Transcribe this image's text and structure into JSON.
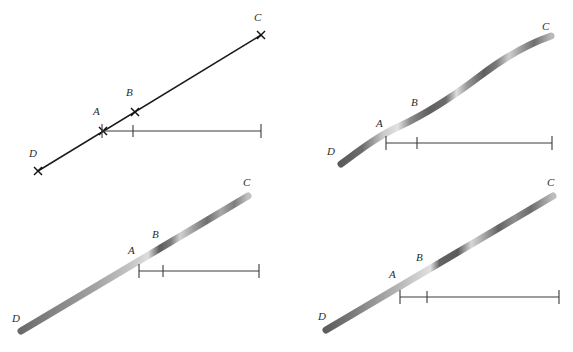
{
  "figure": {
    "title": "",
    "background_color": "#ffffff",
    "width": 573,
    "height": 352,
    "panel_count": 4,
    "point_labels": [
      "A",
      "B",
      "C",
      "D"
    ],
    "line_color": "#1a1a1a",
    "band_dark_color": "#5e5e5e",
    "band_mid_color": "#8f8f8f",
    "band_light_color": "#d8d8d8",
    "ruler_color": "#3a3a3a"
  },
  "panels": [
    {
      "id": "panel-top-left",
      "name": "thin-straight-line-panel",
      "style": "thin-line",
      "labels": {
        "A": "A",
        "B": "B",
        "C": "C",
        "D": "D"
      },
      "label_positions": {
        "A": {
          "x": 93,
          "y": 115
        },
        "B": {
          "x": 126,
          "y": 96
        },
        "C": {
          "x": 254,
          "y": 21
        },
        "D": {
          "x": 29,
          "y": 157
        }
      },
      "line": {
        "x1": 38,
        "y1": 171,
        "x2": 261,
        "y2": 35
      },
      "markers": [
        {
          "label": "D",
          "x": 38,
          "y": 171
        },
        {
          "label": "A",
          "x": 103,
          "y": 131
        },
        {
          "label": "B",
          "x": 135,
          "y": 112
        },
        {
          "label": "C",
          "x": 261,
          "y": 35
        }
      ],
      "ruler": {
        "y": 131,
        "x_start": 102,
        "x_end": 261,
        "ticks": [
          102,
          133,
          261
        ]
      }
    },
    {
      "id": "panel-top-right",
      "name": "curved-band-panel",
      "style": "curved-band",
      "labels": {
        "A": "A",
        "B": "B",
        "C": "C",
        "D": "D"
      },
      "label_positions": {
        "A": {
          "x": 376,
          "y": 127
        },
        "B": {
          "x": 411,
          "y": 106
        },
        "C": {
          "x": 542,
          "y": 30
        },
        "D": {
          "x": 327,
          "y": 155
        }
      },
      "ruler": {
        "y": 143,
        "x_start": 386,
        "x_end": 552,
        "ticks": [
          386,
          417,
          552
        ]
      }
    },
    {
      "id": "panel-bottom-left",
      "name": "straight-band-gradient-panel",
      "style": "straight-band",
      "labels": {
        "A": "A",
        "B": "B",
        "C": "C",
        "D": "D"
      },
      "label_positions": {
        "A": {
          "x": 128,
          "y": 254
        },
        "B": {
          "x": 152,
          "y": 238
        },
        "C": {
          "x": 243,
          "y": 186
        },
        "D": {
          "x": 12,
          "y": 322
        }
      },
      "ruler": {
        "y": 271,
        "x_start": 139,
        "x_end": 259,
        "ticks": [
          139,
          163,
          259
        ]
      }
    },
    {
      "id": "panel-bottom-right",
      "name": "straight-band-segmented-panel",
      "style": "straight-band",
      "labels": {
        "A": "A",
        "B": "B",
        "C": "C",
        "D": "D"
      },
      "label_positions": {
        "A": {
          "x": 389,
          "y": 278
        },
        "B": {
          "x": 416,
          "y": 261
        },
        "C": {
          "x": 547,
          "y": 186
        },
        "D": {
          "x": 318,
          "y": 320
        }
      },
      "ruler": {
        "y": 297,
        "x_start": 400,
        "x_end": 559,
        "ticks": [
          400,
          427,
          559
        ]
      }
    }
  ]
}
